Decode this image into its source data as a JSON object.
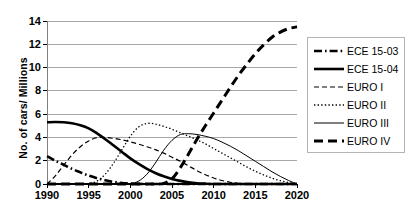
{
  "chart_data": {
    "type": "line",
    "title": "",
    "xlabel": "",
    "ylabel": "No. of cars/ Millions",
    "xlim": [
      1990,
      2020
    ],
    "ylim": [
      0,
      14
    ],
    "grid": "horizontal",
    "legend_position": "right",
    "x_ticks": [
      "1990",
      "1995",
      "2000",
      "2005",
      "2010",
      "2015",
      "2020"
    ],
    "y_ticks": [
      "0",
      "2",
      "4",
      "6",
      "8",
      "10",
      "12",
      "14"
    ],
    "x": [
      1990,
      1991,
      1992,
      1993,
      1994,
      1995,
      1996,
      1997,
      1998,
      1999,
      2000,
      2001,
      2002,
      2003,
      2004,
      2005,
      2006,
      2007,
      2008,
      2009,
      2010,
      2011,
      2012,
      2013,
      2014,
      2015,
      2016,
      2017,
      2018,
      2019,
      2020
    ],
    "series": [
      {
        "name": "ECE 15-03",
        "style": "dash-dot",
        "color": "#000000",
        "width": 2.6,
        "values": [
          2.4,
          2.0,
          1.65,
          1.3,
          1.0,
          0.72,
          0.5,
          0.32,
          0.18,
          0.09,
          0.04,
          0.01,
          0.0,
          0.0,
          0.0,
          0.0,
          0.0,
          0.0,
          0.0,
          0.0,
          0.0,
          0.0,
          0.0,
          0.0,
          0.0,
          0.0,
          0.0,
          0.0,
          0.0,
          0.0,
          0.0
        ]
      },
      {
        "name": "ECE 15-04",
        "style": "solid",
        "color": "#000000",
        "width": 2.6,
        "values": [
          5.3,
          5.32,
          5.3,
          5.22,
          5.05,
          4.78,
          4.35,
          3.85,
          3.3,
          2.75,
          2.2,
          1.72,
          1.3,
          0.95,
          0.66,
          0.44,
          0.27,
          0.15,
          0.07,
          0.03,
          0.0,
          0.0,
          0.0,
          0.0,
          0.0,
          0.0,
          0.0,
          0.0,
          0.0,
          0.0,
          0.0
        ]
      },
      {
        "name": "EURO I",
        "style": "dashed",
        "color": "#000000",
        "width": 1.2,
        "values": [
          0.0,
          0.7,
          1.6,
          2.5,
          3.2,
          3.7,
          3.98,
          4.0,
          3.92,
          3.8,
          3.62,
          3.42,
          3.2,
          2.95,
          2.65,
          2.3,
          1.95,
          1.55,
          1.15,
          0.8,
          0.52,
          0.3,
          0.15,
          0.06,
          0.02,
          0.0,
          0.0,
          0.0,
          0.0,
          0.0,
          0.0
        ]
      },
      {
        "name": "EURO II",
        "style": "dotted",
        "color": "#000000",
        "width": 1.3,
        "values": [
          0.0,
          0.0,
          0.0,
          0.0,
          0.0,
          0.05,
          0.25,
          0.85,
          1.8,
          2.95,
          4.1,
          4.9,
          5.2,
          5.15,
          4.95,
          4.7,
          4.4,
          4.1,
          3.8,
          3.45,
          3.05,
          2.65,
          2.25,
          1.85,
          1.45,
          1.1,
          0.78,
          0.5,
          0.28,
          0.12,
          0.0
        ]
      },
      {
        "name": "EURO III",
        "style": "solid",
        "color": "#000000",
        "width": 1.0,
        "values": [
          0.0,
          0.0,
          0.0,
          0.0,
          0.0,
          0.0,
          0.0,
          0.0,
          0.0,
          0.0,
          0.03,
          0.25,
          0.85,
          1.8,
          2.9,
          3.75,
          4.25,
          4.32,
          4.25,
          4.1,
          3.9,
          3.6,
          3.25,
          2.85,
          2.4,
          1.95,
          1.5,
          1.05,
          0.65,
          0.3,
          0.0
        ]
      },
      {
        "name": "EURO IV",
        "style": "long-dash",
        "color": "#000000",
        "width": 3.0,
        "values": [
          0.0,
          0.0,
          0.0,
          0.0,
          0.0,
          0.0,
          0.0,
          0.0,
          0.0,
          0.0,
          0.0,
          0.0,
          0.0,
          0.0,
          0.05,
          0.45,
          1.4,
          2.6,
          3.85,
          5.0,
          6.1,
          7.2,
          8.3,
          9.35,
          10.3,
          11.2,
          11.95,
          12.6,
          13.05,
          13.35,
          13.5
        ]
      }
    ]
  },
  "legend": {
    "items": [
      {
        "label": "ECE 15-03"
      },
      {
        "label": "ECE 15-04"
      },
      {
        "label": "EURO I"
      },
      {
        "label": "EURO II"
      },
      {
        "label": "EURO III"
      },
      {
        "label": "EURO IV"
      }
    ]
  },
  "colors": {
    "line": "#000000",
    "grid": "#a8a8a8",
    "axis": "#808080",
    "legend_border": "#b4b4b4",
    "background": "#ffffff"
  }
}
